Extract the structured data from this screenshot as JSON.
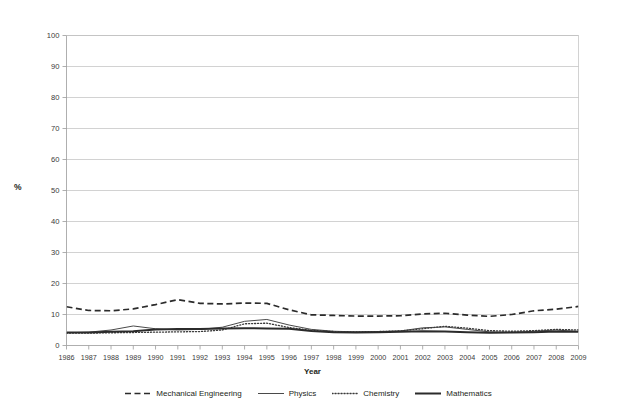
{
  "chart_data": {
    "type": "line",
    "title": "",
    "xlabel": "Year",
    "ylabel": "%",
    "ylim": [
      0,
      100
    ],
    "yticks": [
      0,
      10,
      20,
      30,
      40,
      50,
      60,
      70,
      80,
      90,
      100
    ],
    "grid": true,
    "legend_position": "bottom",
    "categories": [
      "1986",
      "1987",
      "1988",
      "1989",
      "1990",
      "1991",
      "1992",
      "1993",
      "1994",
      "1995",
      "1996",
      "1997",
      "1998",
      "1999",
      "2000",
      "2001",
      "2002",
      "2003",
      "2004",
      "2005",
      "2006",
      "2007",
      "2008",
      "2009"
    ],
    "series": [
      {
        "name": "Mechanical Engineering",
        "style": "dashed",
        "color": "#2b2b2b",
        "values": [
          12.5,
          11.3,
          11.2,
          11.8,
          13.2,
          14.8,
          13.6,
          13.4,
          13.7,
          13.6,
          11.5,
          9.9,
          9.7,
          9.5,
          9.5,
          9.6,
          10.2,
          10.4,
          9.8,
          9.4,
          10.0,
          11.2,
          11.7,
          12.6
        ]
      },
      {
        "name": "Physics",
        "style": "solid-thin",
        "color": "#4a4a4a",
        "values": [
          4.1,
          4.3,
          5.0,
          6.3,
          5.4,
          5.0,
          5.2,
          5.9,
          7.8,
          8.4,
          6.6,
          5.2,
          4.6,
          4.4,
          4.5,
          4.7,
          5.7,
          6.0,
          5.2,
          4.4,
          4.2,
          4.6,
          5.0,
          4.5
        ]
      },
      {
        "name": "Chemistry",
        "style": "dotted",
        "color": "#3a3a3a",
        "values": [
          4.0,
          4.0,
          4.1,
          4.2,
          4.3,
          4.4,
          4.5,
          5.0,
          7.0,
          7.2,
          5.8,
          4.9,
          4.5,
          4.4,
          4.5,
          4.7,
          5.4,
          6.2,
          5.6,
          4.8,
          4.6,
          4.8,
          5.2,
          5.0
        ]
      },
      {
        "name": "Mathematics",
        "style": "solid-thick",
        "color": "#2b2b2b",
        "values": [
          4.2,
          4.2,
          4.4,
          4.6,
          5.2,
          5.3,
          5.3,
          5.5,
          5.6,
          5.5,
          5.4,
          4.7,
          4.3,
          4.2,
          4.3,
          4.4,
          4.6,
          4.5,
          4.3,
          4.1,
          4.2,
          4.3,
          4.5,
          4.4
        ]
      }
    ]
  },
  "legend": {
    "items": [
      {
        "label": "Mechanical Engineering"
      },
      {
        "label": "Physics"
      },
      {
        "label": "Chemistry"
      },
      {
        "label": "Mathematics"
      }
    ]
  },
  "axes": {
    "y_title": "%",
    "x_title": "Year"
  }
}
